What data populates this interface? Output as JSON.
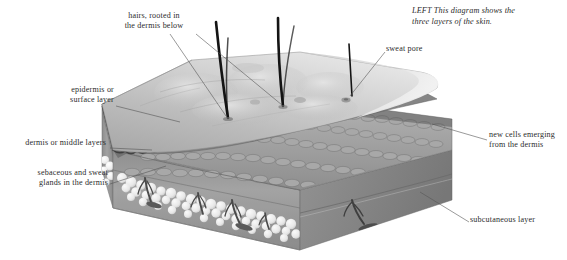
{
  "figure": {
    "caption": {
      "prefix": "LEFT",
      "text": "LEFT This diagram shows the\nthree layers of the skin."
    }
  },
  "labels": {
    "hairs": "hairs, rooted in\nthe dermis below",
    "sweat_pore": "sweat pore",
    "epidermis": "epidermis or\nsurface layer",
    "dermis": "dermis or middle layers",
    "glands": "sebaceous and sweat\nglands in the dermis",
    "new_cells": "new cells emerging\nfrom the dermis",
    "subcutaneous": "subcutaneous layer"
  },
  "colors": {
    "background": "#ffffff",
    "text": "#2b2b2b",
    "leader_line": "#5a5a5a",
    "epidermis_top": "#b9b9b9",
    "epidermis_top_light": "#d6d6d6",
    "epidermis_edge": "#8c8c8c",
    "dermis_face": "#9a9a9a",
    "dermis_face_dark": "#848484",
    "dermis_scallop": "#a3a3a3",
    "subcutaneous_face": "#9d9d9d",
    "fat_cells": "#efefef",
    "hair": "#1a1a1a",
    "gland": "#555555"
  }
}
